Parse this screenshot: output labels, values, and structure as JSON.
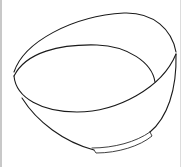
{
  "image": {
    "subject": "bowl line drawing",
    "description": "Outline drawing of an empty tilted bowl with a small foot ring",
    "stroke_color": "#1a1a1a",
    "background_color": "#ffffff",
    "border_color": "#c8c8c8"
  }
}
